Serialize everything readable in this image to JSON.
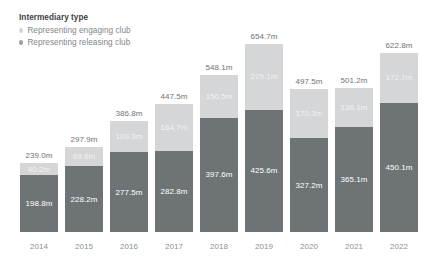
{
  "legend": {
    "title": "Intermediary type",
    "items": [
      {
        "label": "Representing engaging club",
        "color": "#d4d6d7",
        "marker": "circle-marker"
      },
      {
        "label": "Representing releasing club",
        "color": "#6e7376",
        "marker": "circle-marker"
      }
    ]
  },
  "chart_data": {
    "type": "bar",
    "title": "Intermediary type",
    "stacked": true,
    "xlabel": "",
    "ylabel": "",
    "ylim": [
      0,
      654.7
    ],
    "grid": false,
    "legend_position": "top-left",
    "unit_suffix": "m",
    "categories": [
      "2014",
      "2015",
      "2016",
      "2017",
      "2018",
      "2019",
      "2020",
      "2021",
      "2022"
    ],
    "series": [
      {
        "name": "Representing releasing club",
        "color": "#6e7376",
        "values": [
          198.8,
          228.2,
          277.5,
          282.8,
          397.6,
          425.6,
          327.2,
          365.1,
          450.1
        ],
        "labels": [
          "198.8m",
          "228.2m",
          "277.5m",
          "282.8m",
          "397.6m",
          "425.6m",
          "327.2m",
          "365.1m",
          "450.1m"
        ]
      },
      {
        "name": "Representing engaging club",
        "color": "#d4d6d7",
        "values": [
          40.2,
          69.6,
          109.3,
          164.7,
          150.5,
          229.1,
          170.3,
          136.1,
          172.7
        ],
        "labels": [
          "40.2m",
          "69.6m",
          "109.3m",
          "164.7m",
          "150.5m",
          "229.1m",
          "170.3m",
          "136.1m",
          "172.7m"
        ]
      }
    ],
    "totals": [
      239.0,
      297.9,
      386.8,
      447.5,
      548.1,
      654.7,
      497.5,
      501.2,
      622.8
    ],
    "total_labels": [
      "239.0m",
      "297.9m",
      "386.8m",
      "447.5m",
      "548.1m",
      "654.7m",
      "497.5m",
      "501.2m",
      "622.8m"
    ]
  }
}
